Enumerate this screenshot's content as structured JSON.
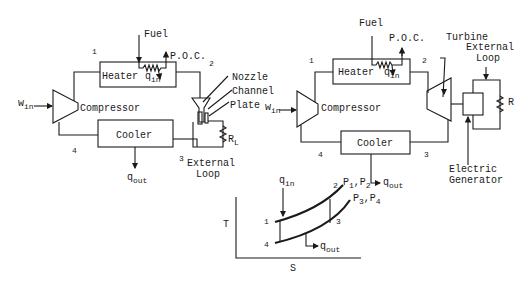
{
  "left_diagram": {
    "title": "MHD power cycle with nozzle and channel",
    "components": {
      "heater": "Heater",
      "compressor": "Compressor",
      "cooler": "Cooler",
      "nozzle": "Nozzle",
      "channel": "Channel",
      "plate": "Plate",
      "external_loop": "External",
      "external_loop2": "Loop"
    },
    "labels": {
      "fuel": "Fuel",
      "poc": "P.O.C.",
      "q_in": "q",
      "q_in_sub": "in",
      "q_out": "q",
      "q_out_sub": "out",
      "w_in": "w",
      "w_in_sub": "in",
      "r_load": "R",
      "r_load_sub": "L"
    },
    "states": [
      "1",
      "2",
      "3",
      "4"
    ]
  },
  "right_diagram": {
    "title": "Gas turbine power cycle",
    "components": {
      "heater": "Heater",
      "compressor": "Compressor",
      "cooler": "Cooler",
      "turbine": "Turbine",
      "external_loop": "External",
      "external_loop2": "Loop",
      "generator": "Electric",
      "generator2": "Generator"
    },
    "labels": {
      "fuel": "Fuel",
      "poc": "P.O.C.",
      "q_in": "q",
      "q_in_sub": "in",
      "q_out": "q",
      "q_out_sub": "out",
      "w_in": "w",
      "w_in_sub": "in",
      "resistor": "R"
    },
    "states": [
      "1",
      "2",
      "3",
      "4"
    ]
  },
  "ts_diagram": {
    "x_label": "S",
    "y_label": "T",
    "q_in": "q",
    "q_in_sub": "in",
    "q_out": "q",
    "q_out_sub": "out",
    "high_pressure": "P",
    "hp_sub1": "1",
    "hp_comma": ",P",
    "hp_sub2": "2",
    "low_pressure": "P",
    "lp_sub1": "3",
    "lp_comma": ",P",
    "lp_sub2": "4",
    "states": [
      "1",
      "2",
      "3",
      "4"
    ]
  }
}
